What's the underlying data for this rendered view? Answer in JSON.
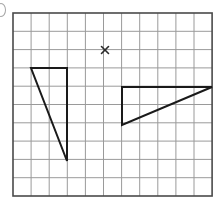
{
  "figure": {
    "canvas": {
      "width": 222,
      "height": 207
    },
    "edge_mark": {
      "name": "clipped-bullet-mark",
      "visible": true
    }
  },
  "grid": {
    "origin_x": 13,
    "origin_y": 13,
    "cell_width": 18.1,
    "cell_height": 18.3,
    "columns": 11,
    "rows": 10,
    "line_color": "#9a9a9a",
    "line_width": 1,
    "border_color": "#4a4a4a",
    "border_width": 1.6
  },
  "shapes": [
    {
      "name": "left-triangle",
      "label": "Left triangle",
      "stroke": "#1a1a1a",
      "stroke_width": 2,
      "fill": "none",
      "points": "31,68 67,68 67,161",
      "vertices": [
        {
          "x": 31,
          "y": 68,
          "cell": "col1,row3"
        },
        {
          "x": 67,
          "y": 68,
          "cell": "col3,row3"
        },
        {
          "x": 67,
          "y": 161,
          "cell": "col3,row8"
        }
      ]
    },
    {
      "name": "right-triangle",
      "label": "Right triangle",
      "stroke": "#1a1a1a",
      "stroke_width": 2,
      "fill": "none",
      "points": "122,87 212,87 122,125",
      "vertices": [
        {
          "x": 122,
          "y": 87,
          "cell": "col6,row4"
        },
        {
          "x": 212,
          "y": 87,
          "cell": "col11,row4"
        },
        {
          "x": 122,
          "y": 125,
          "cell": "col6,row6"
        }
      ]
    }
  ],
  "marks": [
    {
      "name": "x-mark",
      "glyph": "x",
      "x": 105,
      "y": 50,
      "size": 7,
      "stroke": "#2a2a2a",
      "stroke_width": 1.6
    }
  ]
}
